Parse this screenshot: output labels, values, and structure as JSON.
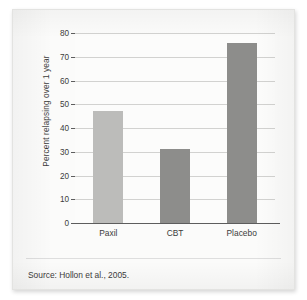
{
  "figure": {
    "source_note": "Source: Hollon et al., 2005."
  },
  "chart_data": {
    "type": "bar",
    "title": "",
    "xlabel": "",
    "ylabel": "Percent relapsing over 1 year",
    "categories": [
      "Paxil",
      "CBT",
      "Placebo"
    ],
    "values": [
      47,
      31,
      76
    ],
    "ylim": [
      0,
      80
    ],
    "yticks": [
      0,
      10,
      20,
      30,
      40,
      50,
      60,
      70,
      80
    ],
    "ytick_labels": [
      "0",
      "10",
      "20",
      "30",
      "40",
      "50",
      "60",
      "70",
      "80"
    ],
    "grid": true,
    "legend": "none",
    "bar_colors": [
      "#bcbcba",
      "#8d8d8b",
      "#8d8d8b"
    ],
    "annotations": [
      "Source: Hollon et al., 2005."
    ]
  }
}
